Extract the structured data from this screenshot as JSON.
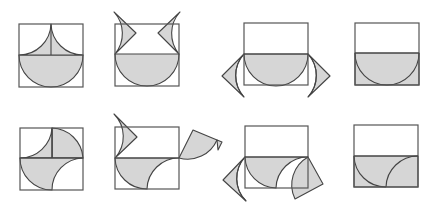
{
  "diagram": {
    "rows": [
      {
        "label": "row-1",
        "panels": [
          "square with semicircle and two cusp pieces",
          "cusp pieces moved out",
          "cusp pieces rotated to sides",
          "lower half rectangle fully shaded"
        ]
      },
      {
        "label": "row-2",
        "panels": [
          "square with quarter-circle pieces",
          "pieces moved out",
          "pieces rotated to sides",
          "lower half rectangle fully shaded with arcs"
        ]
      }
    ],
    "colors": {
      "shade": "#d6d6d6",
      "stroke": "#444444",
      "background": "#ffffff"
    }
  }
}
